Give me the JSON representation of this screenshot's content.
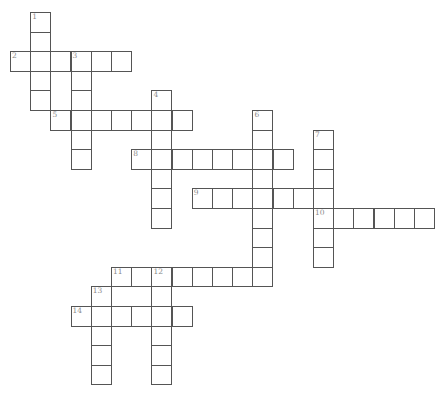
{
  "puzzle": {
    "type": "crossword",
    "words": [
      {
        "number": "1",
        "direction": "down",
        "col": 1,
        "row": 0,
        "length": 5
      },
      {
        "number": "2",
        "direction": "across",
        "col": 0,
        "row": 2,
        "length": 6
      },
      {
        "number": "3",
        "direction": "down",
        "col": 3,
        "row": 2,
        "length": 6
      },
      {
        "number": "4",
        "direction": "down",
        "col": 7,
        "row": 4,
        "length": 7
      },
      {
        "number": "5",
        "direction": "across",
        "col": 2,
        "row": 5,
        "length": 7
      },
      {
        "number": "6",
        "direction": "down",
        "col": 12,
        "row": 5,
        "length": 9
      },
      {
        "number": "7",
        "direction": "down",
        "col": 15,
        "row": 6,
        "length": 7
      },
      {
        "number": "8",
        "direction": "across",
        "col": 6,
        "row": 7,
        "length": 8
      },
      {
        "number": "9",
        "direction": "across",
        "col": 9,
        "row": 9,
        "length": 7
      },
      {
        "number": "10",
        "direction": "across",
        "col": 15,
        "row": 10,
        "length": 6
      },
      {
        "number": "11",
        "direction": "across",
        "col": 5,
        "row": 13,
        "length": 8
      },
      {
        "number": "12",
        "direction": "down",
        "col": 7,
        "row": 13,
        "length": 6
      },
      {
        "number": "13",
        "direction": "down",
        "col": 4,
        "row": 14,
        "length": 5
      },
      {
        "number": "14",
        "direction": "across",
        "col": 3,
        "row": 15,
        "length": 6
      }
    ],
    "colors": {
      "border": "#555555",
      "number": "#8a8a8a",
      "background": "#ffffff"
    }
  }
}
